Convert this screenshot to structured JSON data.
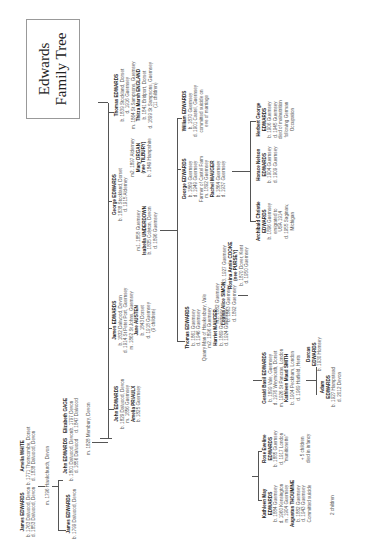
{
  "title": {
    "line1": "Edwards",
    "line2": "Family Tree"
  },
  "people": {
    "james1763": {
      "name": "James EDWARDS",
      "lines": [
        "b. 1763 Dalwood, Devon",
        "d. 1853 Dalwood, Devon"
      ]
    },
    "amelia_white": {
      "name": "Amelia WHITE",
      "lines": [
        "b. 1771 Thorncombe, Dorset",
        "d. 1838 Dalwood, Devon"
      ]
    },
    "marriage1796": {
      "text": "m. 1796 Hawkchurch, Devon"
    },
    "james1799": {
      "name": "James EDWARDS",
      "lines": [
        "b. 1799 Dalwood, Devon"
      ]
    },
    "john1801": {
      "name": "John EDWARDS",
      "lines": [
        "b. 1801 Dalwood, Devon",
        "d. 1856 Dalwood"
      ]
    },
    "elizabeth_gage": {
      "name": "Elizabeth GAGE",
      "lines": [
        "b. 1797 Devon",
        "d. 1847 Dalwood"
      ]
    },
    "marriage1828": {
      "text": "m. 1828 Membury, Devon"
    },
    "john1829": {
      "name": "John EDWARDS",
      "lines": [
        "b. 1829 Dalwood, Devon",
        "m. 1856 Guernsey"
      ],
      "spouse": "Amelia PRIAULX",
      "spouse_lines": [
        "b. 1825 Guernsey"
      ]
    },
    "james1832": {
      "name": "James EDWARDS",
      "lines": [
        "b. 1832 Dalwood, Devon",
        "d. 1914 St Peter Port, Guernsey",
        "m. 1862 St Johns, Guernsey"
      ],
      "spouse": "Jane AUSTEN",
      "spouse_lines": [
        "b. 1843 Dorset",
        "d. 1918 Guernsey",
        "(9 children)"
      ]
    },
    "george1838": {
      "name": "George EDWARDS",
      "lines": [
        "b. 1838 Stockland, Dorset",
        "d. 1915 Alderney"
      ]
    },
    "isabella": {
      "pre": "m1. 1858 Guernsey",
      "name": "Isabella UNDERDOWN",
      "lines": [
        "b. 1835 Colyton, Devon",
        "d. 1896 Guernsey"
      ]
    },
    "mary_organ": {
      "pre": "m2. 1897 Alderney",
      "name": "Mary ORGAN",
      "name2": "(nee TILBURY)",
      "lines": [
        "b. 1849 Hampshire"
      ]
    },
    "thomas1839": {
      "name": "Thomas EDWARDS",
      "lines": [
        "b. 1839 Stockland, Dorset",
        "d. 1916 Guernsey",
        "m. 1864 St Sampsons, Guernsey"
      ],
      "spouse": "Thirza Marsh ENGLAND",
      "spouse_lines": [
        "b. 1841 Bridport, Dorset",
        "d. 1899 St Sampsons, Guernsey",
        "(11 children)"
      ]
    },
    "louisa": {
      "pre": "m1. 1882 Guernsey",
      "name": "Louisa Alice SIMON",
      "lines": [
        "b. 1863 Guernsey",
        "d. 1892 Guernsey"
      ]
    },
    "thomas1861": {
      "name": "Thomas EDWARDS",
      "lines": [
        "b. 1861 Guernsey",
        "d. 1946 Guernsey",
        "Quarry Man of Hawkesbury, Vale",
        "m2. 1896 Guernsey"
      ],
      "spouse": "Harriet MAUGER",
      "spouse_lines": [
        "b. 1869 Guernsey",
        "d. 1924 Guernsey"
      ]
    },
    "rosina": {
      "pre": "m3. 1927 Guernsey",
      "name": "Rosina Annie COOKE",
      "name2": "(nee PURSEY)",
      "lines": [
        "b. 1870 Dover, Kent",
        "d. 1950 Guernsey"
      ]
    },
    "george1869": {
      "name": "George EDWARDS",
      "lines": [
        "b. 1869 Guernsey",
        "d. 1949 Guernsey",
        "Farmer of Castel Farm",
        "m. 1892 Guernsey"
      ],
      "spouse": "Rachel MAUGER",
      "spouse_lines": [
        "b. 1864 Guernsey",
        "d. 1937 Guernsey"
      ]
    },
    "william1870": {
      "name": "William EDWARDS",
      "lines": [
        "b. 1870 Guernsey",
        "d. 1901 Castel, Guernsey",
        "committed suicide on",
        "eve of marriage"
      ]
    },
    "kathleen": {
      "name": "Kathleen May",
      "name2": "EDWARDS",
      "lines": [
        "b. 1884 Guernsey",
        "d. 1960 Kensington",
        "m. 1904 Guernsey"
      ],
      "spouse": "Augustus THOUMINE",
      "spouse_lines": [
        "b. 1882 Guernsey",
        "d. 1943 Guernsey",
        "Committed suicide"
      ]
    },
    "kathleen_children": {
      "text": "2 children"
    },
    "rose": {
      "name": "Rose Eveline",
      "name2": "EDWARDS",
      "lines": [
        "b. 1885 Guernsey",
        "d. 1917 London",
        "\"munitionette\""
      ]
    },
    "infancy": {
      "text1": "+ 5 children",
      "text2": "died in infancy"
    },
    "gerald": {
      "name": "Gerald Basil EDWARDS",
      "lines": [
        "b. 1899 Vale, Guernsey",
        "d. 1976 Weymouth, Dorset",
        "m. 1926 St Pancras, London"
      ],
      "spouse": "Kathleen Maud SMITH",
      "spouse_lines": [
        "b. 1904 Peckham, London",
        "d. 1969 Hatfield, Herts"
      ]
    },
    "adam": {
      "name": "Adam",
      "name2": "EDWARDS",
      "lines": [
        "b. 1927 Hampstead",
        "d. 2012 Devon"
      ]
    },
    "dorcas": {
      "name": "Dorcas",
      "name2": "EDWARDS",
      "lines": [
        "b. 1930 Hornsey"
      ]
    },
    "archibald": {
      "name": "Archibald Christie",
      "name2": "EDWARDS",
      "lines": [
        "b. 1896 Guernsey",
        "emigrated to",
        "USA 1914",
        "d. 1955 Saginaw,",
        "Michigan"
      ]
    },
    "horace": {
      "name": "Horace Nelson",
      "name2": "EDWARDS",
      "lines": [
        "b. 1904 Guernsey",
        "d. 1909 Guernsey"
      ]
    },
    "herbert": {
      "name": "Herbert George",
      "name2": "EDWARDS",
      "lines": [
        "b. 1906 Guernsey",
        "d. 1945 Guernsey",
        "died of malnutrition",
        "following German",
        "Occupation"
      ]
    }
  }
}
